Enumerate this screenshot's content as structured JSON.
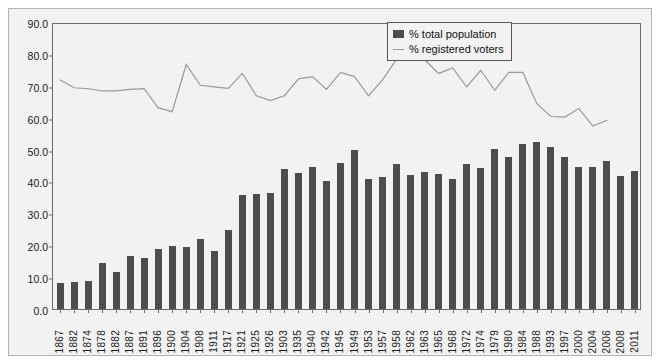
{
  "chart_data": {
    "type": "bar",
    "title": "",
    "subtitle": "",
    "xlabel": "",
    "ylabel": "",
    "ylim": [
      0,
      90
    ],
    "ytick_labels": [
      "0.0",
      "10.0",
      "20.0",
      "30.0",
      "40.0",
      "50.0",
      "60.0",
      "70.0",
      "80.0",
      "90.0"
    ],
    "ytick_values": [
      0,
      10,
      20,
      30,
      40,
      50,
      60,
      70,
      80,
      90
    ],
    "grid": false,
    "legend_position": "top-right",
    "categories": [
      "1867",
      "1882",
      "1874",
      "1878",
      "1882",
      "1887",
      "1891",
      "1896",
      "1900",
      "1904",
      "1908",
      "1911",
      "1917",
      "1921",
      "1925",
      "1926",
      "1903",
      "1935",
      "1940",
      "1942",
      "1945",
      "1949",
      "1953",
      "1957",
      "1958",
      "1962",
      "1963",
      "1965",
      "1968",
      "1972",
      "1974",
      "1979",
      "1980",
      "1984",
      "1988",
      "1993",
      "1997",
      "2000",
      "2004",
      "2006",
      "2008",
      "2011"
    ],
    "series": [
      {
        "name": "% total population",
        "type": "bar",
        "color": "#4d4d4d",
        "values": [
          8.2,
          8.5,
          8.8,
          14.4,
          11.7,
          16.7,
          15.9,
          18.8,
          19.7,
          19.4,
          21.8,
          18.2,
          24.7,
          35.7,
          36.0,
          36.5,
          44.0,
          42.7,
          44.6,
          40.0,
          45.7,
          49.9,
          40.7,
          41.3,
          45.5,
          42.1,
          42.9,
          42.3,
          40.8,
          45.5,
          44.3,
          50.1,
          47.8,
          51.9,
          52.3,
          50.9,
          47.6,
          44.5,
          44.6,
          46.5,
          41.6,
          43.3
        ]
      },
      {
        "name": "% registered voters",
        "type": "line",
        "color": "#9a9a9a",
        "values": [
          72.5,
          70.0,
          69.7,
          69.0,
          69.0,
          69.5,
          69.7,
          63.7,
          62.5,
          77.3,
          70.8,
          70.3,
          69.8,
          74.5,
          67.5,
          66.0,
          67.5,
          72.8,
          73.5,
          69.5,
          74.8,
          73.5,
          67.5,
          72.5,
          79.0,
          78.7,
          78.8,
          74.5,
          76.2,
          70.3,
          75.5,
          69.2,
          74.8,
          74.8,
          65.0,
          61.0,
          60.8,
          63.5,
          58.0,
          59.8,
          null,
          null
        ]
      }
    ]
  },
  "legend": {
    "items": [
      {
        "label": "% total population",
        "marker": "bar-swatch"
      },
      {
        "label": "% registered voters",
        "marker": "line-swatch"
      }
    ]
  }
}
